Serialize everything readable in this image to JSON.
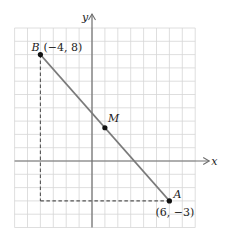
{
  "diagram": {
    "type": "coordinate-plane",
    "axes": {
      "x_label": "x",
      "y_label": "y"
    },
    "grid": {
      "x_min": -6,
      "x_max": 8,
      "y_min": -5,
      "y_max": 10,
      "step": 1
    },
    "points": [
      {
        "name": "B",
        "x": -4,
        "y": 8,
        "coord_label": "(−4, 8)"
      },
      {
        "name": "M",
        "x": 1,
        "y": 2.5,
        "coord_label": ""
      },
      {
        "name": "A",
        "x": 6,
        "y": -3,
        "coord_label": "(6, −3)"
      }
    ],
    "segments": [
      {
        "from": "B",
        "to": "A",
        "style": "solid"
      }
    ],
    "guides": [
      {
        "from": [
          -4,
          8
        ],
        "to": [
          -4,
          -3
        ],
        "style": "dashed"
      },
      {
        "from": [
          -4,
          -3
        ],
        "to": [
          6,
          -3
        ],
        "style": "dashed"
      }
    ],
    "colors": {
      "grid": "#d6d6d6",
      "axis": "#6e6e6e",
      "segment": "#7a7a7a",
      "point": "#111111",
      "text": "#222222"
    }
  }
}
